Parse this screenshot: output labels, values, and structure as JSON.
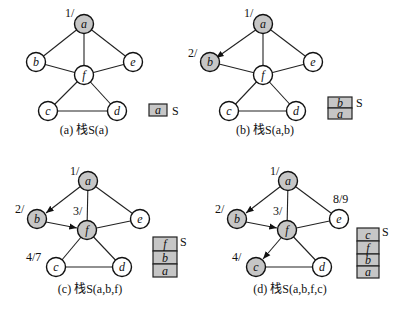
{
  "colors": {
    "visited_fill": "#c6c6c6",
    "unvisited_fill": "#ffffff",
    "stroke": "#111111"
  },
  "panels": [
    {
      "id": "a",
      "caption": "(a) 栈S(a)",
      "stack_label": "S",
      "stack": [
        "a"
      ],
      "nodes": {
        "a": {
          "label": "a",
          "visited": true,
          "time": "1/"
        },
        "b": {
          "label": "b",
          "visited": false,
          "time": ""
        },
        "c": {
          "label": "c",
          "visited": false,
          "time": ""
        },
        "d": {
          "label": "d",
          "visited": false,
          "time": ""
        },
        "e": {
          "label": "e",
          "visited": false,
          "time": ""
        },
        "f": {
          "label": "f",
          "visited": false,
          "time": ""
        }
      },
      "tree_edges": []
    },
    {
      "id": "b",
      "caption": "(b) 栈S(a,b)",
      "stack_label": "S",
      "stack": [
        "b",
        "a"
      ],
      "nodes": {
        "a": {
          "label": "a",
          "visited": true,
          "time": "1/"
        },
        "b": {
          "label": "b",
          "visited": true,
          "time": "2/"
        },
        "c": {
          "label": "c",
          "visited": false,
          "time": ""
        },
        "d": {
          "label": "d",
          "visited": false,
          "time": ""
        },
        "e": {
          "label": "e",
          "visited": false,
          "time": ""
        },
        "f": {
          "label": "f",
          "visited": false,
          "time": ""
        }
      },
      "tree_edges": [
        "a->b"
      ]
    },
    {
      "id": "c",
      "caption": "(c) 栈S(a,b,f)",
      "stack_label": "S",
      "stack": [
        "f",
        "b",
        "a"
      ],
      "nodes": {
        "a": {
          "label": "a",
          "visited": true,
          "time": "1/"
        },
        "b": {
          "label": "b",
          "visited": true,
          "time": "2/"
        },
        "c": {
          "label": "c",
          "visited": false,
          "time": "4/7"
        },
        "d": {
          "label": "d",
          "visited": false,
          "time": ""
        },
        "e": {
          "label": "e",
          "visited": false,
          "time": ""
        },
        "f": {
          "label": "f",
          "visited": true,
          "time": "3/"
        }
      },
      "tree_edges": [
        "a->b",
        "b->f"
      ]
    },
    {
      "id": "d",
      "caption": "(d) 栈S(a,b,f,c)",
      "stack_label": "S",
      "stack": [
        "c",
        "f",
        "b",
        "a"
      ],
      "nodes": {
        "a": {
          "label": "a",
          "visited": true,
          "time": "1/"
        },
        "b": {
          "label": "b",
          "visited": true,
          "time": "2/"
        },
        "c": {
          "label": "c",
          "visited": true,
          "time": "4/"
        },
        "d": {
          "label": "d",
          "visited": false,
          "time": ""
        },
        "e": {
          "label": "e",
          "visited": false,
          "time": "8/9"
        },
        "f": {
          "label": "f",
          "visited": true,
          "time": "3/"
        }
      },
      "tree_edges": [
        "a->b",
        "b->f",
        "f->c"
      ]
    }
  ],
  "graph_edges": [
    "a-b",
    "a-f",
    "a-e",
    "b-f",
    "f-e",
    "f-c",
    "f-d",
    "c-d"
  ]
}
